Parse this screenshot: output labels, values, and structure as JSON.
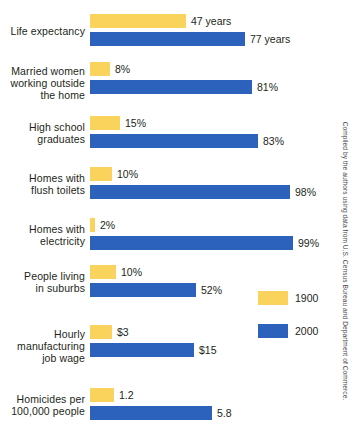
{
  "chart_data": {
    "type": "bar",
    "orientation": "horizontal",
    "title": "",
    "xlabel": "",
    "ylabel": "",
    "grid": false,
    "legend_position": "right-middle",
    "categories": [
      "Life expectancy",
      "Married women working outside the home",
      "High school graduates",
      "Homes with flush toilets",
      "Homes with electricity",
      "People living in suburbs",
      "Hourly manufacturing job wage",
      "Homicides per 100,000 people"
    ],
    "series": [
      {
        "name": "1900",
        "color": "#fad35d",
        "values": [
          47,
          8,
          15,
          10,
          2,
          10,
          3,
          1.2
        ],
        "value_labels": [
          "47 years",
          "8%",
          "15%",
          "10%",
          "2%",
          "10%",
          "$3",
          "1.2"
        ]
      },
      {
        "name": "2000",
        "color": "#2c62bb",
        "values": [
          77,
          81,
          83,
          98,
          99,
          52,
          15,
          5.8
        ],
        "value_labels": [
          "77 years",
          "81%",
          "83%",
          "98%",
          "99%",
          "52%",
          "$15",
          "5.8"
        ]
      }
    ],
    "annotations": [
      "Compiled by the authors using data from U.S. Census Bureau and Department of Commerce."
    ]
  },
  "rows": [
    {
      "label_lines": [
        "Life expectancy"
      ],
      "label_text": "Life expectancy",
      "bar1900": {
        "value_label": "47 years",
        "width_px": 96
      },
      "bar2000": {
        "value_label": "77 years",
        "width_px": 155
      }
    },
    {
      "label_lines": [
        "Married women",
        "working outside",
        "the home"
      ],
      "label_text": "Married women working outside the home",
      "bar1900": {
        "value_label": "8%",
        "width_px": 20
      },
      "bar2000": {
        "value_label": "81%",
        "width_px": 162
      }
    },
    {
      "label_lines": [
        "High school",
        "graduates"
      ],
      "label_text": "High school graduates",
      "bar1900": {
        "value_label": "15%",
        "width_px": 30
      },
      "bar2000": {
        "value_label": "83%",
        "width_px": 168
      }
    },
    {
      "label_lines": [
        "Homes with",
        "flush toilets"
      ],
      "label_text": "Homes with flush toilets",
      "bar1900": {
        "value_label": "10%",
        "width_px": 22
      },
      "bar2000": {
        "value_label": "98%",
        "width_px": 200
      }
    },
    {
      "label_lines": [
        "Homes with",
        "electricity"
      ],
      "label_text": "Homes with electricity",
      "bar1900": {
        "value_label": "2%",
        "width_px": 5
      },
      "bar2000": {
        "value_label": "99%",
        "width_px": 203
      }
    },
    {
      "label_lines": [
        "People living",
        "in suburbs"
      ],
      "label_text": "People living in suburbs",
      "bar1900": {
        "value_label": "10%",
        "width_px": 26
      },
      "bar2000": {
        "value_label": "52%",
        "width_px": 106
      }
    },
    {
      "label_lines": [
        "Hourly",
        "manufacturing",
        "job wage"
      ],
      "label_text": "Hourly manufacturing job wage",
      "bar1900": {
        "value_label": "$3",
        "width_px": 22
      },
      "bar2000": {
        "value_label": "$15",
        "width_px": 104
      }
    },
    {
      "label_lines": [
        "Homicides per",
        "100,000 people"
      ],
      "label_text": "Homicides per 100,000 people",
      "bar1900": {
        "value_label": "1.2",
        "width_px": 24
      },
      "bar2000": {
        "value_label": "5.8",
        "width_px": 122
      }
    }
  ],
  "legend": {
    "items": [
      {
        "label": "1900",
        "color": "#fad35d"
      },
      {
        "label": "2000",
        "color": "#2c62bb"
      }
    ]
  },
  "credit": {
    "text": "Compiled by the authors using data from U.S. Census Bureau and Department of Commerce."
  },
  "colors": {
    "series_1900": "#fad35d",
    "series_2000": "#2c62bb",
    "text": "#231f20",
    "background": "#ffffff"
  }
}
